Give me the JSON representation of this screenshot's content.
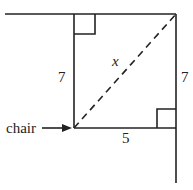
{
  "diagram": {
    "type": "geometry-right-triangle-room-corner",
    "colors": {
      "line": "#222222",
      "background": "#ffffff"
    },
    "labels": {
      "left_side": "7",
      "right_side": "7",
      "bottom_side": "5",
      "diagonal": "x",
      "pointer": "chair"
    }
  }
}
